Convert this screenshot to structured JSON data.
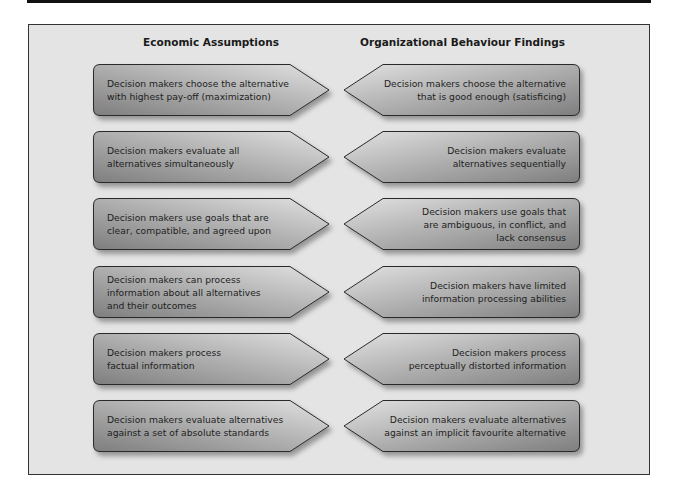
{
  "headers": {
    "left": "Economic Assumptions",
    "right": "Organizational Behaviour Findings"
  },
  "colors": {
    "frame_bg": "#e4e4e4",
    "frame_border": "#333333",
    "shape_dark": "#8a8a8a",
    "shape_light": "#dcdcdc",
    "shape_outline": "#2a2a2a",
    "text": "#1e1e1e"
  },
  "rows": [
    {
      "left": [
        "Decision makers choose the alternative",
        "with highest pay-off (maximization)"
      ],
      "right": [
        "Decision makers choose the alternative",
        "that is good enough (satisficing)"
      ]
    },
    {
      "left": [
        "Decision makers evaluate all",
        "alternatives simultaneously"
      ],
      "right": [
        "Decision makers evaluate",
        "alternatives sequentially"
      ]
    },
    {
      "left": [
        "Decision makers use goals that are",
        "clear, compatible, and agreed upon"
      ],
      "right": [
        "Decision makers use goals that",
        "are ambiguous, in conflict, and",
        "lack consensus"
      ]
    },
    {
      "left": [
        "Decision makers can process",
        "information about all alternatives",
        "and their outcomes"
      ],
      "right": [
        "Decision makers have limited",
        "information processing abilities"
      ]
    },
    {
      "left": [
        "Decision makers process",
        "factual information"
      ],
      "right": [
        "Decision makers process",
        "perceptually distorted information"
      ]
    },
    {
      "left": [
        "Decision makers evaluate alternatives",
        "against a set of absolute standards"
      ],
      "right": [
        "Decision makers evaluate alternatives",
        "against an implicit favourite alternative"
      ]
    }
  ]
}
